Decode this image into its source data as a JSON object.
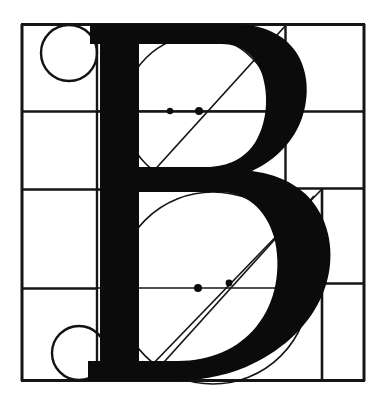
{
  "figure": {
    "glyph": "B",
    "style": "serif-roman-capital",
    "ink_color": "#0b0b0b",
    "line_color": "#151515",
    "background_color": "#ffffff",
    "canvas": {
      "width": 389,
      "height": 411
    }
  },
  "grid": {
    "frame": {
      "left": 21,
      "top": 24,
      "right": 365,
      "bottom": 381
    },
    "stroke_width_outer": 3.0,
    "stroke_width_inner": 2.6,
    "horizontal_rules": [
      {
        "name": "cap-line",
        "y": 24,
        "x_start": 21,
        "x_end": 365
      },
      {
        "name": "upper-bowl-axis",
        "y": 111,
        "x_start": 21,
        "x_end": 365
      },
      {
        "name": "waist-line",
        "y": 189,
        "x_start": 21,
        "x_end": 365
      },
      {
        "name": "lower-bowl-axis",
        "y": 288,
        "x_start": 21,
        "x_end": 365
      },
      {
        "name": "base-line",
        "y": 381,
        "x_start": 21,
        "x_end": 365
      }
    ],
    "vertical_rules": [
      {
        "name": "left-margin",
        "x": 21,
        "y_start": 24,
        "y_end": 381
      },
      {
        "name": "left-column-edge",
        "x": 97,
        "y_start": 24,
        "y_end": 381
      },
      {
        "name": "right-column-edge",
        "x": 285,
        "y_start": 24,
        "y_end": 189
      },
      {
        "name": "lower-right-column-edge",
        "x": 322,
        "y_start": 189,
        "y_end": 381
      },
      {
        "name": "right-margin",
        "x": 365,
        "y_start": 24,
        "y_end": 381
      }
    ]
  },
  "circles": [
    {
      "name": "top-left-module-circle",
      "cx": 69,
      "cy": 53,
      "r": 28
    },
    {
      "name": "bottom-left-module-circle",
      "cx": 79,
      "cy": 353,
      "r": 27
    }
  ],
  "construction_lines": {
    "upper_bowl_diagonals": [
      {
        "name": "upper-stress-diagonal",
        "x1": 140,
        "y1": 186,
        "x2": 287,
        "y2": 24
      }
    ],
    "upper_bowl_axis": {
      "name": "upper-bowl-axis-segment",
      "x1": 97,
      "y1": 111,
      "x2": 285,
      "y2": 111
    },
    "lower_bowl_diagonals": [
      {
        "name": "lower-stress-diagonal-outer",
        "x1": 148,
        "y1": 369,
        "x2": 322,
        "y2": 189
      },
      {
        "name": "lower-stress-diagonal-inner",
        "x1": 155,
        "y1": 372,
        "x2": 314,
        "y2": 196
      }
    ],
    "lower_bowl_axis": {
      "name": "lower-bowl-axis-segment",
      "x1": 97,
      "y1": 288,
      "x2": 322,
      "y2": 288
    },
    "corner_diagonal": {
      "name": "lower-right-corner-diagonal",
      "x1": 285,
      "y1": 189,
      "x2": 322,
      "y2": 230
    }
  },
  "node_points": [
    {
      "name": "upper-axis-node-left",
      "cx": 170,
      "cy": 111,
      "r": 3.2
    },
    {
      "name": "upper-axis-node-center",
      "cx": 199,
      "cy": 111,
      "r": 4.0
    },
    {
      "name": "lower-axis-node-left",
      "cx": 198,
      "cy": 288,
      "r": 4.0
    },
    {
      "name": "lower-axis-node-right",
      "cx": 229,
      "cy": 283,
      "r": 3.4
    }
  ],
  "glyph_metrics": {
    "stem_left": 100,
    "stem_right": 139,
    "cap_height_top": 24,
    "baseline": 381,
    "upper_bowl_right": 287,
    "lower_bowl_right": 322,
    "top_serif_left": 90,
    "top_serif_right": 156,
    "bottom_serif_left": 88,
    "bottom_serif_right": 158
  }
}
